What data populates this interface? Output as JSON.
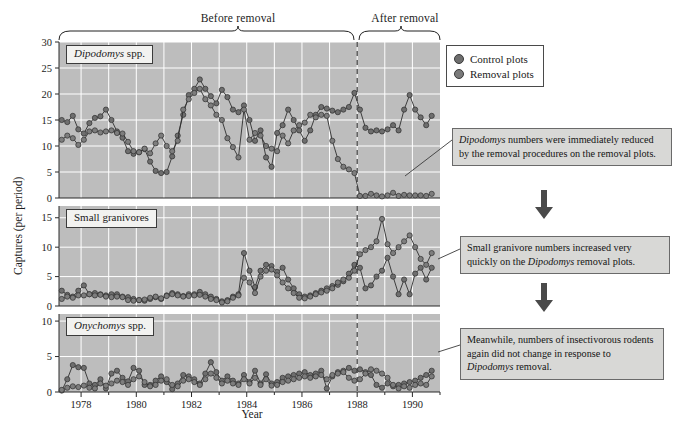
{
  "figure": {
    "phase_before": "Before removal",
    "phase_after": "After removal",
    "y_axis_title": "Captures (per period)",
    "x_axis_title": "Year",
    "removal_year": 1988.0
  },
  "legend": {
    "title": "",
    "items": [
      {
        "label": "Control plots",
        "color": "#6e6e6e"
      },
      {
        "label": "Removal plots",
        "color": "#7a7a7a"
      }
    ]
  },
  "annotations": [
    {
      "id": "anno-dipodomys",
      "text_parts": [
        "Dipodomys",
        " numbers were immediately reduced by the removal procedures on the removal plots."
      ]
    },
    {
      "id": "anno-granivore",
      "text_parts": [
        "Small granivore numbers increased very quickly on the ",
        "Dipodomys",
        " removal plots."
      ]
    },
    {
      "id": "anno-onychomys",
      "text_parts": [
        "Meanwhile, numbers of insectivorous rodents again did not change in response to ",
        "Dipodomys",
        " removal."
      ]
    }
  ],
  "arrows": [
    {
      "name": "arrow-down-1"
    },
    {
      "name": "arrow-down-2"
    }
  ],
  "chart_data": {
    "type": "line",
    "title": "",
    "xlabel": "Year",
    "ylabel": "Captures (per period)",
    "xlim": [
      1977.2,
      1991.0
    ],
    "xticks": [
      1978,
      1980,
      1982,
      1984,
      1986,
      1988,
      1990
    ],
    "grid": true,
    "legend_position": "top-right",
    "vline": {
      "x": 1988.0,
      "style": "dashed",
      "label": "removal"
    },
    "panels": [
      {
        "name": "Dipodomys spp.",
        "ylim": [
          0,
          30
        ],
        "yticks": [
          0,
          5,
          10,
          15,
          20,
          25,
          30
        ],
        "series": [
          {
            "name": "Control plots",
            "x": [
              1977.3,
              1977.5,
              1977.7,
              1977.9,
              1978.1,
              1978.3,
              1978.5,
              1978.7,
              1978.9,
              1979.1,
              1979.3,
              1979.5,
              1979.7,
              1979.9,
              1980.1,
              1980.3,
              1980.5,
              1980.7,
              1980.9,
              1981.1,
              1981.3,
              1981.5,
              1981.7,
              1981.9,
              1982.1,
              1982.3,
              1982.5,
              1982.7,
              1982.9,
              1983.1,
              1983.3,
              1983.5,
              1983.7,
              1983.9,
              1984.1,
              1984.3,
              1984.5,
              1984.7,
              1984.9,
              1985.1,
              1985.3,
              1985.5,
              1985.7,
              1985.9,
              1986.1,
              1986.3,
              1986.5,
              1986.7,
              1986.9,
              1987.1,
              1987.3,
              1987.5,
              1987.7,
              1987.9,
              1988.1,
              1988.3,
              1988.5,
              1988.7,
              1988.9,
              1989.1,
              1989.3,
              1989.5,
              1989.7,
              1989.9,
              1990.1,
              1990.3,
              1990.5,
              1990.7
            ],
            "values": [
              15.0,
              14.6,
              15.8,
              13.2,
              12.4,
              14.4,
              15.4,
              15.7,
              17.0,
              15.0,
              12.8,
              11.6,
              9.0,
              8.5,
              8.8,
              9.4,
              7.0,
              5.2,
              4.8,
              5.0,
              8.0,
              12.0,
              16.0,
              19.8,
              21.0,
              22.8,
              21.0,
              19.6,
              18.2,
              20.8,
              19.4,
              17.0,
              16.5,
              17.8,
              15.0,
              11.0,
              13.0,
              7.8,
              6.0,
              12.5,
              14.0,
              17.0,
              15.0,
              13.0,
              11.0,
              13.0,
              16.0,
              17.5,
              17.2,
              16.8,
              16.5,
              17.0,
              17.5,
              20.2,
              17.0,
              13.5,
              12.8,
              13.0,
              12.8,
              13.2,
              14.0,
              13.0,
              17.0,
              19.8,
              17.0,
              15.5,
              14.0,
              15.8
            ]
          },
          {
            "name": "Removal plots",
            "x": [
              1977.3,
              1977.5,
              1977.7,
              1977.9,
              1978.1,
              1978.3,
              1978.5,
              1978.7,
              1978.9,
              1979.1,
              1979.3,
              1979.5,
              1979.7,
              1979.9,
              1980.1,
              1980.3,
              1980.5,
              1980.7,
              1980.9,
              1981.1,
              1981.3,
              1981.5,
              1981.7,
              1981.9,
              1982.1,
              1982.3,
              1982.5,
              1982.7,
              1982.9,
              1983.1,
              1983.3,
              1983.5,
              1983.7,
              1983.9,
              1984.1,
              1984.3,
              1984.5,
              1984.7,
              1984.9,
              1985.1,
              1985.3,
              1985.5,
              1985.7,
              1985.9,
              1986.1,
              1986.3,
              1986.5,
              1986.7,
              1986.9,
              1987.1,
              1987.3,
              1987.5,
              1987.7,
              1987.9,
              1988.1,
              1988.3,
              1988.5,
              1988.7,
              1988.9,
              1989.1,
              1989.3,
              1989.5,
              1989.7,
              1989.9,
              1990.1,
              1990.3,
              1990.5,
              1990.7
            ],
            "values": [
              11.2,
              12.0,
              11.5,
              10.2,
              11.2,
              12.8,
              13.0,
              12.6,
              12.8,
              13.0,
              12.5,
              12.4,
              10.8,
              9.0,
              8.8,
              9.5,
              8.6,
              10.5,
              12.0,
              10.0,
              9.0,
              11.0,
              17.0,
              19.0,
              20.2,
              21.0,
              19.0,
              17.8,
              16.0,
              15.0,
              11.5,
              9.8,
              7.8,
              17.0,
              11.2,
              12.5,
              12.0,
              10.0,
              9.5,
              9.0,
              12.0,
              10.5,
              13.0,
              14.0,
              14.5,
              16.0,
              15.5,
              16.0,
              15.8,
              11.0,
              7.5,
              6.0,
              5.5,
              4.8,
              0.4,
              0.4,
              0.8,
              0.5,
              0.3,
              0.5,
              1.0,
              0.4,
              0.6,
              0.5,
              0.5,
              0.5,
              0.4,
              0.8
            ]
          }
        ]
      },
      {
        "name": "Small granivores",
        "ylim": [
          0,
          17
        ],
        "yticks": [
          0,
          5,
          10,
          15
        ],
        "series": [
          {
            "name": "Control plots",
            "x": [
              1977.3,
              1977.5,
              1977.7,
              1977.9,
              1978.1,
              1978.3,
              1978.5,
              1978.7,
              1978.9,
              1979.1,
              1979.3,
              1979.5,
              1979.7,
              1979.9,
              1980.1,
              1980.3,
              1980.5,
              1980.7,
              1980.9,
              1981.1,
              1981.3,
              1981.5,
              1981.7,
              1981.9,
              1982.1,
              1982.3,
              1982.5,
              1982.7,
              1982.9,
              1983.1,
              1983.3,
              1983.5,
              1983.7,
              1983.9,
              1984.1,
              1984.3,
              1984.5,
              1984.7,
              1984.9,
              1985.1,
              1985.3,
              1985.5,
              1985.7,
              1985.9,
              1986.1,
              1986.3,
              1986.5,
              1986.7,
              1986.9,
              1987.1,
              1987.3,
              1987.5,
              1987.7,
              1987.9,
              1988.1,
              1988.3,
              1988.5,
              1988.7,
              1988.9,
              1989.1,
              1989.3,
              1989.5,
              1989.7,
              1989.9,
              1990.1,
              1990.3,
              1990.5,
              1990.7
            ],
            "values": [
              2.6,
              1.9,
              1.6,
              2.6,
              3.5,
              2.0,
              2.2,
              2.0,
              1.8,
              2.0,
              2.0,
              1.6,
              1.5,
              1.2,
              1.0,
              0.9,
              1.2,
              1.5,
              1.2,
              1.8,
              2.2,
              2.0,
              1.7,
              2.0,
              2.0,
              2.4,
              2.0,
              1.6,
              1.2,
              0.8,
              1.0,
              1.6,
              2.0,
              9.0,
              6.0,
              3.2,
              6.0,
              7.0,
              6.8,
              5.8,
              6.5,
              4.5,
              3.0,
              2.0,
              1.6,
              1.8,
              2.2,
              2.6,
              3.0,
              3.4,
              3.6,
              4.2,
              5.5,
              7.0,
              6.5,
              3.0,
              3.5,
              5.0,
              6.0,
              8.2,
              5.0,
              2.0,
              4.5,
              2.0,
              5.5,
              6.5,
              4.5,
              6.5
            ]
          },
          {
            "name": "Removal plots",
            "x": [
              1977.3,
              1977.5,
              1977.7,
              1977.9,
              1978.1,
              1978.3,
              1978.5,
              1978.7,
              1978.9,
              1979.1,
              1979.3,
              1979.5,
              1979.7,
              1979.9,
              1980.1,
              1980.3,
              1980.5,
              1980.7,
              1980.9,
              1981.1,
              1981.3,
              1981.5,
              1981.7,
              1981.9,
              1982.1,
              1982.3,
              1982.5,
              1982.7,
              1982.9,
              1983.1,
              1983.3,
              1983.5,
              1983.7,
              1983.9,
              1984.1,
              1984.3,
              1984.5,
              1984.7,
              1984.9,
              1985.1,
              1985.3,
              1985.5,
              1985.7,
              1985.9,
              1986.1,
              1986.3,
              1986.5,
              1986.7,
              1986.9,
              1987.1,
              1987.3,
              1987.5,
              1987.7,
              1987.9,
              1988.1,
              1988.3,
              1988.5,
              1988.7,
              1988.9,
              1989.1,
              1989.3,
              1989.5,
              1989.7,
              1989.9,
              1990.1,
              1990.3,
              1990.5,
              1990.7
            ],
            "values": [
              1.2,
              1.6,
              1.4,
              1.8,
              1.8,
              2.0,
              1.8,
              1.9,
              1.6,
              1.5,
              1.6,
              1.5,
              1.0,
              0.9,
              1.0,
              1.1,
              1.4,
              1.6,
              1.3,
              1.7,
              2.0,
              1.8,
              1.6,
              1.7,
              1.8,
              1.9,
              1.6,
              1.2,
              1.0,
              0.6,
              0.8,
              1.4,
              1.8,
              4.8,
              4.0,
              2.2,
              5.0,
              6.0,
              6.2,
              5.2,
              4.0,
              3.0,
              2.2,
              1.4,
              1.3,
              1.6,
              2.0,
              2.3,
              2.6,
              3.0,
              4.0,
              4.5,
              4.8,
              6.0,
              8.8,
              9.5,
              10.0,
              11.0,
              14.8,
              10.5,
              9.0,
              10.0,
              11.0,
              12.0,
              10.0,
              8.0,
              7.0,
              9.0
            ]
          }
        ]
      },
      {
        "name": "Onychomys spp.",
        "ylim": [
          0,
          11
        ],
        "yticks": [
          0,
          5,
          10
        ],
        "series": [
          {
            "name": "Control plots",
            "x": [
              1977.3,
              1977.5,
              1977.7,
              1977.9,
              1978.1,
              1978.3,
              1978.5,
              1978.7,
              1978.9,
              1979.1,
              1979.3,
              1979.5,
              1979.7,
              1979.9,
              1980.1,
              1980.3,
              1980.5,
              1980.7,
              1980.9,
              1981.1,
              1981.3,
              1981.5,
              1981.7,
              1981.9,
              1982.1,
              1982.3,
              1982.5,
              1982.7,
              1982.9,
              1983.1,
              1983.3,
              1983.5,
              1983.7,
              1983.9,
              1984.1,
              1984.3,
              1984.5,
              1984.7,
              1984.9,
              1985.1,
              1985.3,
              1985.5,
              1985.7,
              1985.9,
              1986.1,
              1986.3,
              1986.5,
              1986.7,
              1986.9,
              1987.1,
              1987.3,
              1987.5,
              1987.7,
              1987.9,
              1988.1,
              1988.3,
              1988.5,
              1988.7,
              1988.9,
              1989.1,
              1989.3,
              1989.5,
              1989.7,
              1989.9,
              1990.1,
              1990.3,
              1990.5,
              1990.7
            ],
            "values": [
              0.2,
              1.8,
              3.8,
              3.5,
              3.4,
              1.2,
              1.0,
              1.8,
              0.5,
              2.6,
              3.0,
              2.0,
              1.5,
              3.4,
              3.0,
              1.0,
              1.0,
              1.6,
              2.2,
              1.4,
              0.4,
              1.2,
              2.4,
              2.2,
              1.8,
              1.2,
              2.6,
              4.2,
              2.8,
              1.6,
              2.2,
              1.6,
              1.2,
              2.4,
              1.4,
              3.0,
              1.2,
              2.5,
              1.2,
              1.4,
              2.0,
              2.2,
              2.4,
              2.6,
              2.8,
              2.4,
              2.6,
              3.0,
              0.5,
              2.2,
              2.8,
              3.0,
              3.4,
              3.0,
              3.2,
              2.8,
              2.4,
              1.0,
              0.6,
              1.2,
              0.8,
              1.0,
              1.2,
              1.4,
              1.6,
              2.0,
              2.4,
              3.0
            ]
          },
          {
            "name": "Removal plots",
            "x": [
              1977.3,
              1977.5,
              1977.7,
              1977.9,
              1978.1,
              1978.3,
              1978.5,
              1978.7,
              1978.9,
              1979.1,
              1979.3,
              1979.5,
              1979.7,
              1979.9,
              1980.1,
              1980.3,
              1980.5,
              1980.7,
              1980.9,
              1981.1,
              1981.3,
              1981.5,
              1981.7,
              1981.9,
              1982.1,
              1982.3,
              1982.5,
              1982.7,
              1982.9,
              1983.1,
              1983.3,
              1983.5,
              1983.7,
              1983.9,
              1984.1,
              1984.3,
              1984.5,
              1984.7,
              1984.9,
              1985.1,
              1985.3,
              1985.5,
              1985.7,
              1985.9,
              1986.1,
              1986.3,
              1986.5,
              1986.7,
              1986.9,
              1987.1,
              1987.3,
              1987.5,
              1987.7,
              1987.9,
              1988.1,
              1988.3,
              1988.5,
              1988.7,
              1988.9,
              1989.1,
              1989.3,
              1989.5,
              1989.7,
              1989.9,
              1990.1,
              1990.3,
              1990.5,
              1990.7
            ],
            "values": [
              0.3,
              0.6,
              0.8,
              0.7,
              0.9,
              0.6,
              0.5,
              1.2,
              0.9,
              1.2,
              1.6,
              1.4,
              1.0,
              1.8,
              2.2,
              1.4,
              0.8,
              1.0,
              1.6,
              1.8,
              1.0,
              0.8,
              1.6,
              1.8,
              1.4,
              1.0,
              1.8,
              2.6,
              2.0,
              1.2,
              1.6,
              1.2,
              1.0,
              1.8,
              1.2,
              2.0,
              1.0,
              1.8,
              0.9,
              1.0,
              1.4,
              1.6,
              1.8,
              2.0,
              2.2,
              2.0,
              2.2,
              2.4,
              1.8,
              2.4,
              2.6,
              2.8,
              2.0,
              1.6,
              1.8,
              2.6,
              3.2,
              3.0,
              2.6,
              2.0,
              1.0,
              0.5,
              0.8,
              0.6,
              1.0,
              1.2,
              1.0,
              2.2
            ]
          }
        ]
      }
    ]
  }
}
